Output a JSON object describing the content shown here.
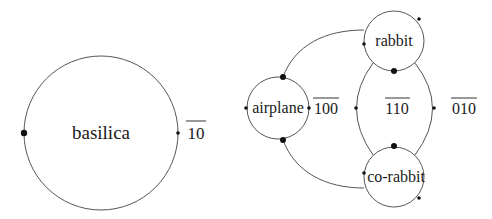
{
  "diagrams": [
    {
      "name": "basilica",
      "nodes": [
        {
          "id": "basilica",
          "label": "basilica",
          "cx": 101,
          "cy": 133,
          "r": 77,
          "font_size": 19
        }
      ],
      "edge_labels": [
        {
          "text": "10",
          "overline": true,
          "x": 196,
          "y": 139
        }
      ],
      "dots": [
        {
          "x": 24,
          "y": 133,
          "r": 3.2
        },
        {
          "x": 178,
          "y": 133,
          "r": 1.8
        }
      ]
    },
    {
      "name": "airplane-rabbit",
      "nodes": [
        {
          "id": "airplane",
          "label": "airplane",
          "cx": 278,
          "cy": 108,
          "r": 31,
          "font_size": 16
        },
        {
          "id": "rabbit",
          "label": "rabbit",
          "cx": 394,
          "cy": 41,
          "r": 30,
          "font_size": 16
        },
        {
          "id": "co-rabbit",
          "label": "co-rabbit",
          "cx": 394,
          "cy": 177,
          "r": 30,
          "font_size": 16
        }
      ],
      "edge_labels": [
        {
          "text": "100",
          "overline": true,
          "x": 326,
          "y": 114
        },
        {
          "text": "110",
          "overline": true,
          "x": 397,
          "y": 114
        },
        {
          "text": "010",
          "overline": true,
          "x": 464,
          "y": 114
        }
      ],
      "dots": [
        {
          "x": 283,
          "y": 77,
          "r": 3
        },
        {
          "x": 283,
          "y": 140,
          "r": 3
        },
        {
          "x": 246,
          "y": 108,
          "r": 1.8
        },
        {
          "x": 309,
          "y": 108,
          "r": 1.8
        },
        {
          "x": 394,
          "y": 71,
          "r": 3
        },
        {
          "x": 394,
          "y": 146,
          "r": 3
        },
        {
          "x": 419,
          "y": 19,
          "r": 1.8
        },
        {
          "x": 364,
          "y": 44,
          "r": 1.8
        },
        {
          "x": 364,
          "y": 173,
          "r": 1.8
        },
        {
          "x": 419,
          "y": 198,
          "r": 1.8
        },
        {
          "x": 356,
          "y": 108,
          "r": 1.8
        },
        {
          "x": 434,
          "y": 108,
          "r": 1.8
        }
      ]
    }
  ]
}
